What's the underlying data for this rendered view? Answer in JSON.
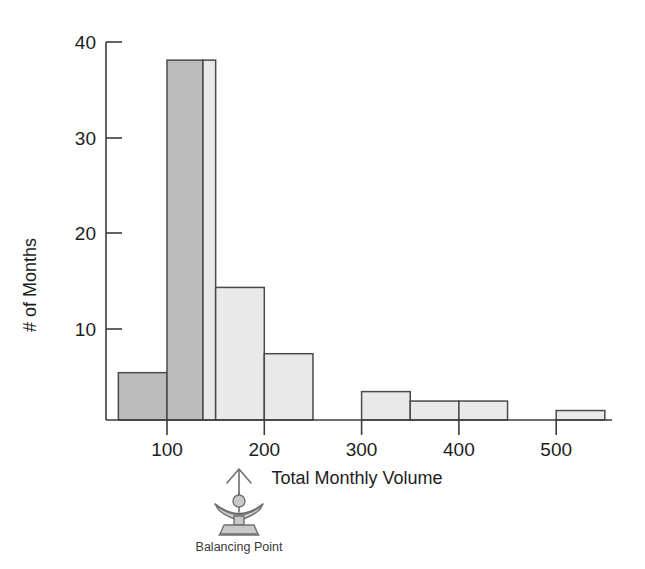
{
  "chart_data": {
    "type": "bar",
    "title": "",
    "subtitle": "",
    "xlabel": "Total Monthly Volume",
    "ylabel": "# of Months",
    "xlim": [
      50,
      570
    ],
    "ylim": [
      0,
      40
    ],
    "grid": false,
    "legend": "none",
    "bin_width": 50,
    "x_tick_labels": [
      "100",
      "200",
      "300",
      "400",
      "500"
    ],
    "x_ticks": [
      100,
      200,
      300,
      400,
      500
    ],
    "y_tick_labels": [
      "10",
      "20",
      "30",
      "40"
    ],
    "y_ticks": [
      10,
      20,
      30,
      40
    ],
    "bins": [
      {
        "name": "bin-50-100",
        "x0": 50,
        "x1": 100,
        "value": 5,
        "fill": "#bcbcbc"
      },
      {
        "name": "bin-100-137",
        "x0": 100,
        "x1": 137,
        "value": 38,
        "fill": "#bcbcbc"
      },
      {
        "name": "bin-137-150",
        "x0": 137,
        "x1": 150,
        "value": 38,
        "fill": "#e9e9e9"
      },
      {
        "name": "bin-150-200",
        "x0": 150,
        "x1": 200,
        "value": 14,
        "fill": "#e9e9e9"
      },
      {
        "name": "bin-200-250",
        "x0": 200,
        "x1": 250,
        "value": 7,
        "fill": "#e9e9e9"
      },
      {
        "name": "bin-300-350",
        "x0": 300,
        "x1": 350,
        "value": 3,
        "fill": "#e9e9e9"
      },
      {
        "name": "bin-350-400",
        "x0": 350,
        "x1": 400,
        "value": 2,
        "fill": "#e9e9e9"
      },
      {
        "name": "bin-400-450",
        "x0": 400,
        "x1": 450,
        "value": 2,
        "fill": "#e9e9e9"
      },
      {
        "name": "bin-500-550",
        "x0": 500,
        "x1": 550,
        "value": 1,
        "fill": "#e9e9e9"
      }
    ],
    "annotations": [
      {
        "name": "balancing-point",
        "label": "Balancing Point",
        "x_value": 137,
        "icon": "fulcrum-balance-icon"
      }
    ],
    "colors": {
      "bar_dark": "#bcbcbc",
      "bar_light": "#e9e9e9",
      "bar_stroke": "#4a4a4a",
      "axis": "#3d3d3d",
      "text": "#1d1d1d",
      "annotation_text": "#3a3a3a",
      "background": "#ffffff"
    }
  }
}
